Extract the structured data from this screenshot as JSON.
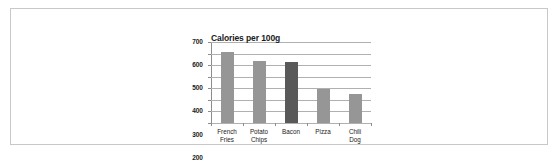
{
  "document": {
    "frame_border_color": "#c8c8c8",
    "background_color": "#ffffff"
  },
  "chart_data": {
    "type": "bar",
    "title": "Calories per 100g",
    "xlabel": "",
    "ylabel": "",
    "categories": [
      "French Fries",
      "Potato Chips",
      "Bacon",
      "Pizza",
      "Chili Dog"
    ],
    "values": [
      610,
      540,
      530,
      290,
      250
    ],
    "bar_colors": [
      "#969696",
      "#969696",
      "#595959",
      "#969696",
      "#969696"
    ],
    "ylim": [
      0,
      700
    ],
    "yticks": [
      0,
      100,
      200,
      300,
      400,
      500,
      600,
      700
    ],
    "ytick_labels": [
      "0",
      "100",
      "200",
      "300",
      "400",
      "500",
      "600",
      "700"
    ],
    "grid": true,
    "grid_color": "#b0b0b0",
    "axis_color": "#8c8c8c",
    "legend": null,
    "legend_position": "none"
  }
}
